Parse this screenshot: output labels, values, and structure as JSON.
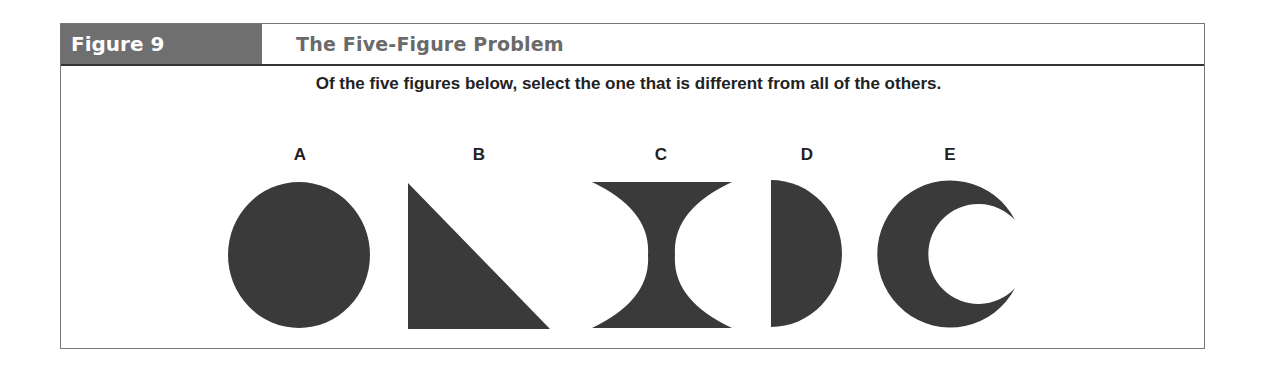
{
  "figure": {
    "label": "Figure 9",
    "title": "The Five-Figure Problem",
    "instruction": "Of the five figures below, select the one that is different from all of the others."
  },
  "options": [
    {
      "letter": "A",
      "shape": "circle"
    },
    {
      "letter": "B",
      "shape": "right-triangle"
    },
    {
      "letter": "C",
      "shape": "hourglass-concave"
    },
    {
      "letter": "D",
      "shape": "half-circle"
    },
    {
      "letter": "E",
      "shape": "crescent"
    }
  ],
  "colors": {
    "shape_fill": "#3a3a3a",
    "label_bg": "#6f6f6f",
    "title_text": "#6a6a6a"
  }
}
